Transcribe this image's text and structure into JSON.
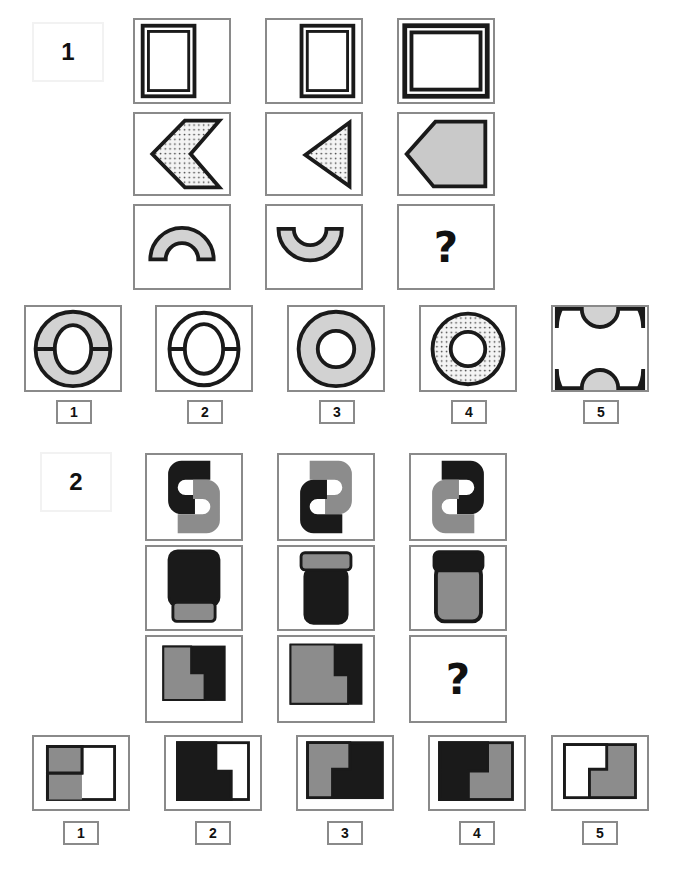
{
  "page": {
    "kind": "non-verbal-reasoning-matrix-test",
    "background": "#ffffff",
    "width": 680,
    "height": 883
  },
  "palette": {
    "black": "#1a1a1a",
    "gray": "#8c8c8c",
    "light_gray_fill": "#d8d8d8",
    "cell_border": "#8a8a8a",
    "white": "#ffffff",
    "dot_fill": "#f0f0f0"
  },
  "puzzles": [
    {
      "id": "puzzle-1",
      "number": "1",
      "matrix": {
        "rows": [
          {
            "row": 1,
            "cells": [
              {
                "id": "p1r1c1",
                "shape": "double-outline-rectangle",
                "orientation": "portrait",
                "fill": "white",
                "size": "narrow-tall",
                "align": "left"
              },
              {
                "id": "p1r1c2",
                "shape": "double-outline-rectangle",
                "orientation": "portrait",
                "fill": "white",
                "size": "narrow-tall",
                "align": "right"
              },
              {
                "id": "p1r1c3",
                "shape": "double-outline-rectangle",
                "orientation": "landscape",
                "fill": "white",
                "size": "large-square",
                "align": "center"
              }
            ]
          },
          {
            "row": 2,
            "cells": [
              {
                "id": "p1r2c1",
                "shape": "chevron-left",
                "fill": "dotted",
                "size": "large"
              },
              {
                "id": "p1r2c2",
                "shape": "triangle-left",
                "fill": "dotted",
                "size": "small"
              },
              {
                "id": "p1r2c3",
                "shape": "pentagon-left-point",
                "fill": "solid-gray",
                "size": "large"
              }
            ]
          },
          {
            "row": 3,
            "cells": [
              {
                "id": "p1r3c1",
                "shape": "arch-up",
                "fill": "solid-gray",
                "size": "medium"
              },
              {
                "id": "p1r3c2",
                "shape": "arch-down",
                "fill": "solid-gray",
                "size": "medium"
              },
              {
                "id": "p1r3c3",
                "shape": "question-mark",
                "label": "?"
              }
            ]
          }
        ]
      },
      "options": [
        {
          "label": "1",
          "shape": "ring-with-horizontal-line",
          "fill": "solid-gray",
          "ring": "thick-oval"
        },
        {
          "label": "2",
          "shape": "ring-with-horizontal-line",
          "fill": "white",
          "ring": "thin-oval"
        },
        {
          "label": "3",
          "shape": "ring-plain",
          "fill": "solid-gray",
          "ring": "thick-circle"
        },
        {
          "label": "4",
          "shape": "ring-plain",
          "fill": "dotted",
          "ring": "thick-circle"
        },
        {
          "label": "5",
          "shape": "double-arch-hourglass",
          "fill": "solid-gray"
        }
      ]
    },
    {
      "id": "puzzle-2",
      "number": "2",
      "matrix": {
        "rows": [
          {
            "row": 1,
            "cells": [
              {
                "id": "p2r1c1",
                "shape": "s-shape",
                "variant": "s-normal",
                "top_color": "black",
                "bottom_color": "gray"
              },
              {
                "id": "p2r1c2",
                "shape": "s-shape",
                "variant": "s-mirrored",
                "top_color": "gray",
                "bottom_color": "black"
              },
              {
                "id": "p2r1c3",
                "shape": "s-shape",
                "variant": "s-mirrored",
                "top_color": "black",
                "bottom_color": "gray"
              }
            ]
          },
          {
            "row": 2,
            "cells": [
              {
                "id": "p2r2c1",
                "shape": "jar",
                "cap_position": "bottom",
                "cap_color": "gray",
                "body_color": "black"
              },
              {
                "id": "p2r2c2",
                "shape": "jar",
                "cap_position": "top",
                "cap_color": "gray",
                "body_color": "black"
              },
              {
                "id": "p2r2c3",
                "shape": "jar",
                "cap_position": "top",
                "cap_color": "black",
                "body_color": "gray"
              }
            ]
          },
          {
            "row": 3,
            "cells": [
              {
                "id": "p2r3c1",
                "shape": "l-split-rectangle",
                "variant": "small",
                "l_color": "gray",
                "ground_color": "black"
              },
              {
                "id": "p2r3c2",
                "shape": "l-split-rectangle",
                "variant": "large",
                "l_color": "gray",
                "ground_color": "black"
              },
              {
                "id": "p2r3c3",
                "shape": "question-mark",
                "label": "?"
              }
            ]
          }
        ]
      },
      "options": [
        {
          "label": "1",
          "shape": "l-split-rectangle",
          "l_color": "gray",
          "ground_color": "white"
        },
        {
          "label": "2",
          "shape": "l-split-rectangle",
          "l_color": "black",
          "ground_color": "white"
        },
        {
          "label": "3",
          "shape": "l-split-rectangle",
          "l_color": "gray",
          "ground_color": "black"
        },
        {
          "label": "4",
          "shape": "l-split-rectangle-mirrored",
          "l_color": "black",
          "ground_color": "gray"
        },
        {
          "label": "5",
          "shape": "l-split-rectangle-mirrored",
          "l_color": "white",
          "ground_color": "gray"
        }
      ]
    }
  ]
}
